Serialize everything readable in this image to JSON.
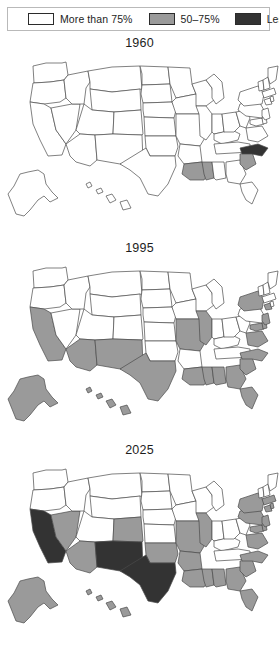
{
  "legend": {
    "items": [
      {
        "label": "More than 75%",
        "color": "#ffffff",
        "swatch_name": "legend-swatch-white"
      },
      {
        "label": "50–75%",
        "color": "#9a9a9a",
        "swatch_name": "legend-swatch-gray"
      },
      {
        "label": "Less than 50%",
        "color": "#333333",
        "swatch_name": "legend-swatch-black"
      }
    ]
  },
  "colors": {
    "white": "#ffffff",
    "gray": "#9a9a9a",
    "black": "#333333",
    "outline": "#4a4a4a"
  },
  "maps": [
    {
      "title": "1960",
      "states": {
        "WA": "white",
        "OR": "white",
        "CA": "white",
        "NV": "white",
        "ID": "white",
        "MT": "white",
        "WY": "white",
        "UT": "white",
        "AZ": "white",
        "CO": "white",
        "NM": "white",
        "ND": "white",
        "SD": "white",
        "NE": "white",
        "KS": "white",
        "OK": "white",
        "TX": "white",
        "MN": "white",
        "IA": "white",
        "MO": "white",
        "AR": "white",
        "LA": "gray",
        "WI": "white",
        "IL": "white",
        "MS": "gray",
        "AL": "white",
        "MI": "white",
        "IN": "white",
        "KY": "white",
        "TN": "white",
        "OH": "white",
        "WV": "white",
        "GA": "white",
        "FL": "white",
        "SC": "gray",
        "NC": "black",
        "VA": "white",
        "MD": "white",
        "DE": "white",
        "PA": "white",
        "NJ": "white",
        "NY": "white",
        "CT": "white",
        "RI": "white",
        "MA": "white",
        "VT": "white",
        "NH": "white",
        "ME": "white",
        "AK": "white",
        "HI": "white"
      }
    },
    {
      "title": "1995",
      "states": {
        "WA": "white",
        "OR": "white",
        "CA": "gray",
        "NV": "white",
        "ID": "white",
        "MT": "white",
        "WY": "white",
        "UT": "white",
        "AZ": "gray",
        "CO": "white",
        "NM": "gray",
        "ND": "white",
        "SD": "white",
        "NE": "white",
        "KS": "white",
        "OK": "white",
        "TX": "gray",
        "MN": "white",
        "IA": "white",
        "MO": "gray",
        "AR": "white",
        "LA": "gray",
        "WI": "white",
        "IL": "gray",
        "MS": "gray",
        "AL": "gray",
        "MI": "white",
        "IN": "white",
        "KY": "white",
        "TN": "white",
        "OH": "white",
        "WV": "white",
        "GA": "gray",
        "FL": "gray",
        "SC": "gray",
        "NC": "gray",
        "VA": "gray",
        "MD": "gray",
        "DE": "gray",
        "PA": "white",
        "NJ": "gray",
        "NY": "gray",
        "CT": "gray",
        "RI": "white",
        "MA": "white",
        "VT": "white",
        "NH": "white",
        "ME": "white",
        "AK": "gray",
        "HI": "gray"
      }
    },
    {
      "title": "2025",
      "states": {
        "WA": "white",
        "OR": "white",
        "CA": "black",
        "NV": "gray",
        "ID": "white",
        "MT": "white",
        "WY": "white",
        "UT": "white",
        "AZ": "gray",
        "CO": "gray",
        "NM": "black",
        "ND": "white",
        "SD": "white",
        "NE": "white",
        "KS": "white",
        "OK": "gray",
        "TX": "black",
        "MN": "white",
        "IA": "white",
        "MO": "gray",
        "AR": "gray",
        "LA": "gray",
        "WI": "white",
        "IL": "gray",
        "MS": "gray",
        "AL": "gray",
        "MI": "white",
        "IN": "white",
        "KY": "white",
        "TN": "white",
        "OH": "white",
        "WV": "white",
        "GA": "gray",
        "FL": "gray",
        "SC": "gray",
        "NC": "gray",
        "VA": "gray",
        "MD": "gray",
        "DE": "gray",
        "PA": "gray",
        "NJ": "gray",
        "NY": "gray",
        "CT": "gray",
        "RI": "gray",
        "MA": "gray",
        "VT": "white",
        "NH": "white",
        "ME": "white",
        "AK": "gray",
        "HI": "gray"
      }
    }
  ]
}
